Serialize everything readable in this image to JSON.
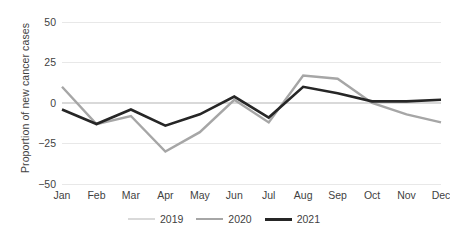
{
  "chart_data": {
    "type": "line",
    "title": "",
    "xlabel": "",
    "ylabel": "Proportion of new cancer cases",
    "categories": [
      "Jan",
      "Feb",
      "Mar",
      "Apr",
      "May",
      "Jun",
      "Jul",
      "Aug",
      "Sep",
      "Oct",
      "Nov",
      "Dec"
    ],
    "ylim": [
      -50,
      50
    ],
    "yticks": [
      50,
      25,
      0,
      -25,
      -50
    ],
    "ytick_labels": [
      "50",
      "25",
      "0",
      "−25",
      "−50"
    ],
    "grid": true,
    "legend_position": "bottom",
    "series": [
      {
        "name": "2019",
        "color": "#d9d9d9",
        "width": 2.2,
        "values": [
          0,
          0,
          0,
          0,
          0,
          0,
          0,
          0,
          0,
          0,
          0,
          0
        ]
      },
      {
        "name": "2020",
        "color": "#a6a6a6",
        "width": 2.4,
        "values": [
          10,
          -13,
          -8,
          -30,
          -18,
          2,
          -12,
          17,
          15,
          0,
          -7,
          -12
        ]
      },
      {
        "name": "2021",
        "color": "#262626",
        "width": 2.6,
        "values": [
          -4,
          -13,
          -4,
          -14,
          -7,
          4,
          -9,
          10,
          6,
          1,
          1,
          2
        ]
      }
    ]
  },
  "legend": {
    "items": [
      {
        "label": "2019"
      },
      {
        "label": "2020"
      },
      {
        "label": "2021"
      }
    ]
  },
  "colors": {
    "background": "#ffffff",
    "gridline": "#e8e8e8",
    "text": "#3f3f3f"
  }
}
